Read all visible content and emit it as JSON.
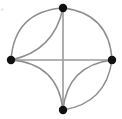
{
  "figure": {
    "background_color": "#ffffff",
    "width": 122,
    "height": 119
  },
  "chart_data": {
    "type": "diagram",
    "diagram_kind": "graph",
    "title": "",
    "xlabel": "",
    "ylabel": "",
    "node_color": "#101010",
    "straight_edge_color": "#9a9a9a",
    "curved_edge_color": "#8e8e8e",
    "node_radius": 4.2,
    "nodes": [
      {
        "id": "top",
        "label": "",
        "x": 63,
        "y": 8
      },
      {
        "id": "left",
        "label": "",
        "x": 11,
        "y": 60
      },
      {
        "id": "right",
        "label": "",
        "x": 112,
        "y": 60
      },
      {
        "id": "bottom",
        "label": "",
        "x": 63,
        "y": 110
      }
    ],
    "edges": [
      {
        "source": "left",
        "target": "right",
        "style": "straight",
        "bulge": 0
      },
      {
        "source": "top",
        "target": "bottom",
        "style": "straight",
        "bulge": 0
      },
      {
        "source": "top",
        "target": "left",
        "style": "curved",
        "bulge": 16
      },
      {
        "source": "top",
        "target": "left",
        "style": "curved",
        "bulge": -12
      },
      {
        "source": "top",
        "target": "right",
        "style": "curved",
        "bulge": -15
      },
      {
        "source": "left",
        "target": "bottom",
        "style": "curved",
        "bulge": -15
      },
      {
        "source": "right",
        "target": "bottom",
        "style": "curved",
        "bulge": 14
      },
      {
        "source": "right",
        "target": "bottom",
        "style": "curved",
        "bulge": -13
      }
    ],
    "edge_count": 8,
    "node_count": 4,
    "legend": [],
    "annotations": []
  },
  "artifacts": {
    "speck_label": "faint-speck",
    "speck_x": 2,
    "speck_y": 9
  }
}
